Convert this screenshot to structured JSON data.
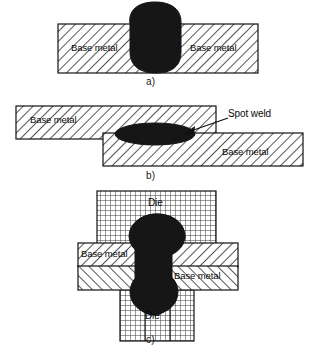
{
  "figure": {
    "background_color": "#ffffff",
    "ink_color": "#111111",
    "weld_color": "#1a1a1a",
    "hatch_color": "#333333"
  },
  "panels": [
    {
      "id": "a",
      "label": "a)",
      "description": "Fusion weld nugget through single plate",
      "parts": [
        {
          "name": "base-metal-left",
          "label": "Base metal",
          "fill": "diagonal-hatch"
        },
        {
          "name": "base-metal-right",
          "label": "Base metal",
          "fill": "diagonal-hatch"
        },
        {
          "name": "weld-nugget",
          "label": "",
          "fill": "solid-dark"
        }
      ]
    },
    {
      "id": "b",
      "label": "b)",
      "description": "Spot weld between two lapped sheets",
      "parts": [
        {
          "name": "base-metal-upper",
          "label": "Base metal",
          "fill": "diagonal-hatch"
        },
        {
          "name": "base-metal-lower",
          "label": "Base metal",
          "fill": "diagonal-hatch"
        },
        {
          "name": "spot-weld-nugget",
          "label": "Spot weld",
          "fill": "solid-dark"
        }
      ],
      "annotation": {
        "text": "Spot weld",
        "leader": "arrow pointing down-left to nugget"
      }
    },
    {
      "id": "c",
      "label": "c)",
      "description": "Rivet-like weld formed between upper and lower dies",
      "parts": [
        {
          "name": "die-upper",
          "label": "Die",
          "fill": "grid-hatch"
        },
        {
          "name": "die-lower",
          "label": "Die",
          "fill": "grid-hatch"
        },
        {
          "name": "base-metal-upper",
          "label": "Base metal",
          "fill": "diagonal-hatch"
        },
        {
          "name": "base-metal-lower",
          "label": "Base metal",
          "fill": "diagonal-hatch"
        },
        {
          "name": "weld-rivet",
          "label": "",
          "fill": "solid-dark"
        }
      ]
    }
  ],
  "labels": {
    "base_metal": "Base metal",
    "spot_weld": "Spot weld",
    "die": "Die",
    "panel_a": "a)",
    "panel_b": "b)",
    "panel_c": "c)"
  }
}
